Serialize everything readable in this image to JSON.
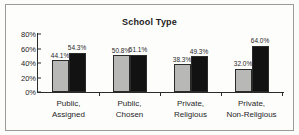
{
  "chart_data": {
    "type": "bar",
    "title": "School Type",
    "xlabel": "",
    "ylabel": "",
    "ylim": [
      0,
      80
    ],
    "grid": false,
    "legend": "none",
    "ytick_labels": [
      "80%",
      "60%",
      "40%",
      "20%",
      "0%"
    ],
    "ytick_values": [
      80,
      60,
      40,
      20,
      0
    ],
    "categories": [
      {
        "line1": "Public,",
        "line2": "Assigned"
      },
      {
        "line1": "Public,",
        "line2": "Chosen"
      },
      {
        "line1": "Private,",
        "line2": "Religious"
      },
      {
        "line1": "Private,",
        "line2": "Non-Religious"
      }
    ],
    "series": [
      {
        "name": "gray",
        "color": "#b8b8b6",
        "values": [
          44.1,
          50.8,
          38.3,
          32.0
        ],
        "labels": [
          "44.1%",
          "50.8%",
          "38.3%",
          "32.0%"
        ]
      },
      {
        "name": "black",
        "color": "#121212",
        "values": [
          54.3,
          51.1,
          49.3,
          64.0
        ],
        "labels": [
          "54.3%",
          "51.1%",
          "49.3%",
          "64.0%"
        ]
      }
    ]
  }
}
